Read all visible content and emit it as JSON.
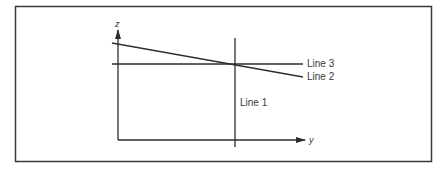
{
  "diagram": {
    "axes": {
      "vertical_label": "z",
      "horizontal_label": "y"
    },
    "lines": [
      {
        "id": "line1",
        "label": "Line 1",
        "orientation": "vertical"
      },
      {
        "id": "line2",
        "label": "Line 2",
        "orientation": "sloped-down"
      },
      {
        "id": "line3",
        "label": "Line 3",
        "orientation": "horizontal"
      }
    ],
    "colors": {
      "stroke": "#2e2e2e",
      "frame": "#3a3a3a",
      "text": "#3a3a3a",
      "background": "#ffffff"
    }
  }
}
